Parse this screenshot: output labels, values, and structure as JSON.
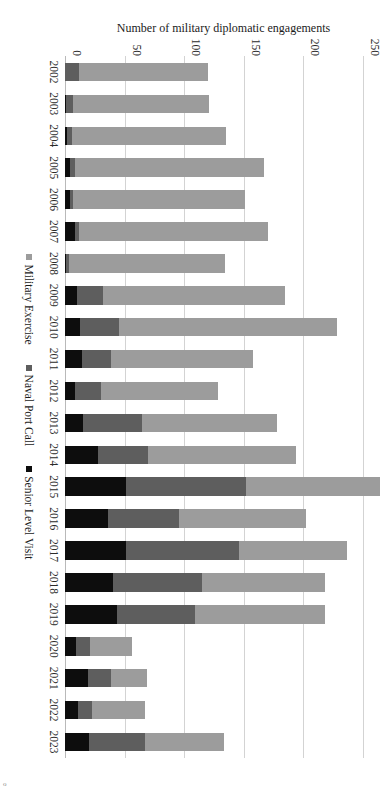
{
  "chart_data": {
    "type": "bar",
    "subtype": "stacked-horizontal",
    "title": "",
    "xlabel": "",
    "ylabel": "Number of military diplomatic engagements",
    "ylim": [
      0,
      250
    ],
    "yticks": [
      0,
      50,
      100,
      150,
      200,
      250
    ],
    "grid": true,
    "orientation": "rotated-90-ccw",
    "legend_position": "bottom",
    "categories": [
      "2002",
      "2003",
      "2004",
      "2005",
      "2006",
      "2007",
      "2008",
      "2009",
      "2010",
      "2011",
      "2012",
      "2013",
      "2014",
      "2015",
      "2016",
      "2017",
      "2018",
      "2019",
      "2020",
      "2021",
      "2022",
      "2023"
    ],
    "series": [
      {
        "name": "Senior Level Visit",
        "color": "#0d0d0d",
        "values": [
          0,
          1,
          2,
          4,
          4,
          8,
          1,
          10,
          13,
          14,
          8,
          15,
          28,
          51,
          36,
          51,
          40,
          44,
          9,
          19,
          11,
          20
        ]
      },
      {
        "name": "Naval Port Call",
        "color": "#5e5e5e",
        "values": [
          12,
          6,
          4,
          4,
          3,
          4,
          2,
          22,
          32,
          25,
          22,
          50,
          42,
          101,
          60,
          95,
          75,
          65,
          12,
          20,
          12,
          47
        ]
      },
      {
        "name": "Military Exercise",
        "color": "#9c9c9c",
        "values": [
          108,
          114,
          129,
          159,
          144,
          158,
          131,
          153,
          183,
          119,
          98,
          113,
          124,
          112,
          106,
          91,
          103,
          109,
          35,
          30,
          44,
          66
        ]
      }
    ],
    "totals": [
      120,
      121,
      135,
      167,
      151,
      170,
      134,
      185,
      228,
      158,
      128,
      178,
      194,
      264,
      202,
      237,
      218,
      218,
      56,
      69,
      67,
      133
    ]
  },
  "legend": {
    "items": [
      {
        "label": "Military Exercise",
        "color": "#9c9c9c"
      },
      {
        "label": "Naval Port Call",
        "color": "#5e5e5e"
      },
      {
        "label": "Senior Level Visit",
        "color": "#0d0d0d"
      }
    ]
  },
  "axis": {
    "y_label": "Number of military diplomatic engagements",
    "y_ticks": [
      "0",
      "50",
      "100",
      "150",
      "200",
      "250"
    ]
  },
  "corner": {
    "mark": "o"
  }
}
